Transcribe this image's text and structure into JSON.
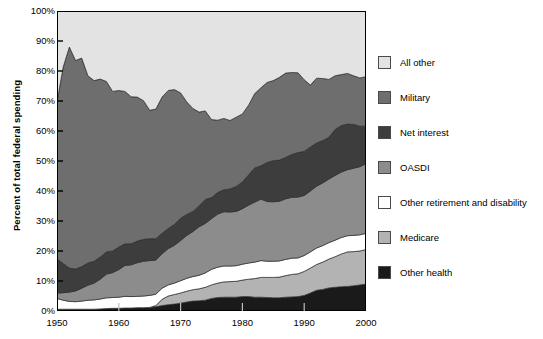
{
  "chart_data": {
    "type": "area",
    "stacked": true,
    "title": "",
    "xlabel": "",
    "ylabel": "Percent of total federal spending",
    "xlim": [
      1950,
      2000
    ],
    "ylim": [
      0,
      100
    ],
    "grid": false,
    "legend_position": "right",
    "x_ticks": [
      "1950",
      "1960",
      "1970",
      "1980",
      "1990",
      "2000"
    ],
    "y_ticks": [
      "0%",
      "10%",
      "20%",
      "30%",
      "40%",
      "50%",
      "60%",
      "70%",
      "80%",
      "90%",
      "100%"
    ],
    "x": [
      1950,
      1951,
      1952,
      1953,
      1954,
      1955,
      1956,
      1957,
      1958,
      1959,
      1960,
      1961,
      1962,
      1963,
      1964,
      1965,
      1966,
      1967,
      1968,
      1969,
      1970,
      1971,
      1972,
      1973,
      1974,
      1975,
      1976,
      1977,
      1978,
      1979,
      1980,
      1981,
      1982,
      1983,
      1984,
      1985,
      1986,
      1987,
      1988,
      1989,
      1990,
      1991,
      1992,
      1993,
      1994,
      1995,
      1996,
      1997,
      1998,
      1999,
      2000
    ],
    "stack_order_bottom_to_top": [
      "Other health",
      "Medicare",
      "Other retirement and disability",
      "OASDI",
      "Net interest",
      "Military",
      "All other"
    ],
    "series": [
      {
        "name": "Other health",
        "color": "#1a1a1a",
        "values": [
          0.6,
          0.6,
          0.6,
          0.6,
          0.6,
          0.6,
          0.6,
          0.7,
          0.8,
          0.9,
          0.9,
          1.0,
          1.0,
          1.1,
          1.1,
          1.2,
          1.4,
          1.8,
          2.1,
          2.3,
          2.6,
          3.0,
          3.3,
          3.4,
          3.6,
          4.2,
          4.5,
          4.6,
          4.6,
          4.6,
          4.8,
          4.8,
          4.6,
          4.6,
          4.5,
          4.4,
          4.4,
          4.6,
          4.7,
          4.8,
          5.2,
          6.0,
          6.9,
          7.2,
          7.7,
          7.9,
          8.1,
          8.2,
          8.4,
          8.7,
          9.0
        ]
      },
      {
        "name": "Medicare",
        "color": "#b3b3b3",
        "values": [
          0.0,
          0.0,
          0.0,
          0.0,
          0.0,
          0.0,
          0.0,
          0.0,
          0.0,
          0.0,
          0.0,
          0.0,
          0.0,
          0.0,
          0.0,
          0.0,
          0.4,
          2.1,
          2.9,
          3.2,
          3.4,
          3.6,
          3.8,
          4.0,
          4.3,
          4.5,
          4.8,
          5.1,
          5.2,
          5.3,
          5.5,
          5.8,
          6.2,
          6.6,
          6.7,
          6.8,
          6.9,
          7.2,
          7.5,
          7.6,
          8.0,
          8.3,
          8.6,
          9.1,
          9.6,
          10.2,
          10.9,
          11.5,
          11.4,
          11.3,
          11.5
        ]
      },
      {
        "name": "Other retirement and disability",
        "color": "#ffffff",
        "values": [
          3.6,
          3.0,
          2.6,
          2.5,
          2.7,
          3.0,
          3.1,
          3.3,
          3.6,
          3.6,
          3.7,
          3.9,
          3.8,
          3.8,
          3.9,
          4.0,
          3.8,
          3.7,
          3.7,
          3.8,
          4.1,
          4.3,
          4.4,
          4.5,
          4.8,
          5.2,
          5.3,
          5.3,
          5.2,
          5.2,
          5.3,
          5.4,
          5.5,
          5.6,
          5.4,
          5.4,
          5.4,
          5.4,
          5.4,
          5.3,
          5.3,
          5.4,
          5.5,
          5.5,
          5.5,
          5.5,
          5.5,
          5.4,
          5.4,
          5.4,
          5.4
        ]
      },
      {
        "name": "OASDI",
        "color": "#8c8c8c",
        "values": [
          1.8,
          2.5,
          3.1,
          3.6,
          4.3,
          5.0,
          5.6,
          6.6,
          7.9,
          8.3,
          9.2,
          10.3,
          10.6,
          11.2,
          11.6,
          11.6,
          11.4,
          11.5,
          12.1,
          12.6,
          13.4,
          14.3,
          15.0,
          16.2,
          16.5,
          16.9,
          17.7,
          18.1,
          18.0,
          18.1,
          18.5,
          19.3,
          20.0,
          20.5,
          19.9,
          19.8,
          19.9,
          20.2,
          20.3,
          20.3,
          20.0,
          20.3,
          20.6,
          20.9,
          21.2,
          21.6,
          21.8,
          22.0,
          22.4,
          22.7,
          23.2
        ]
      },
      {
        "name": "Net interest",
        "color": "#3d3d3d",
        "values": [
          11.4,
          9.7,
          8.0,
          7.3,
          7.2,
          7.4,
          7.3,
          7.4,
          7.4,
          7.2,
          7.5,
          7.2,
          7.0,
          7.2,
          7.3,
          7.3,
          7.1,
          6.8,
          6.7,
          7.0,
          7.4,
          7.0,
          6.7,
          7.0,
          8.0,
          7.0,
          7.2,
          7.3,
          7.7,
          8.3,
          8.9,
          10.1,
          11.4,
          11.1,
          13.0,
          13.7,
          13.7,
          13.8,
          14.3,
          14.8,
          14.7,
          14.7,
          14.4,
          14.1,
          13.9,
          15.3,
          15.5,
          15.2,
          14.6,
          13.5,
          12.5
        ]
      },
      {
        "name": "Military",
        "color": "#6e6e6e",
        "values": [
          52.2,
          65.5,
          73.7,
          69.5,
          69.5,
          62.4,
          60.2,
          59.3,
          56.8,
          53.2,
          52.2,
          50.8,
          49.0,
          48.0,
          46.2,
          42.8,
          43.2,
          45.4,
          46.0,
          44.9,
          41.8,
          37.5,
          34.3,
          31.2,
          29.5,
          26.0,
          24.1,
          23.8,
          22.8,
          23.1,
          22.7,
          23.2,
          24.8,
          26.0,
          26.7,
          26.7,
          27.6,
          28.1,
          27.3,
          26.6,
          23.9,
          20.6,
          21.6,
          20.7,
          19.3,
          17.9,
          17.0,
          16.9,
          16.2,
          16.1,
          16.5
        ]
      },
      {
        "name": "All other",
        "color": "#e3e3e3",
        "values": [
          30.4,
          18.7,
          12.0,
          16.5,
          15.7,
          21.6,
          23.2,
          22.7,
          23.5,
          26.8,
          26.5,
          26.8,
          28.6,
          28.7,
          29.9,
          33.1,
          32.7,
          28.7,
          26.5,
          26.2,
          27.3,
          30.3,
          32.5,
          33.7,
          33.3,
          36.2,
          36.4,
          35.6,
          36.5,
          35.4,
          34.3,
          31.4,
          27.5,
          26.0,
          23.8,
          23.2,
          22.1,
          20.7,
          20.5,
          20.6,
          22.9,
          24.7,
          22.4,
          22.5,
          22.8,
          21.6,
          21.2,
          20.8,
          21.6,
          22.3,
          21.9
        ]
      }
    ],
    "legend": [
      {
        "label": "All other",
        "color": "#e3e3e3"
      },
      {
        "label": "Military",
        "color": "#6e6e6e"
      },
      {
        "label": "Net interest",
        "color": "#3d3d3d"
      },
      {
        "label": "OASDI",
        "color": "#8c8c8c"
      },
      {
        "label": "Other retirement and disability",
        "color": "#ffffff"
      },
      {
        "label": "Medicare",
        "color": "#b3b3b3"
      },
      {
        "label": "Other health",
        "color": "#1a1a1a"
      }
    ]
  }
}
